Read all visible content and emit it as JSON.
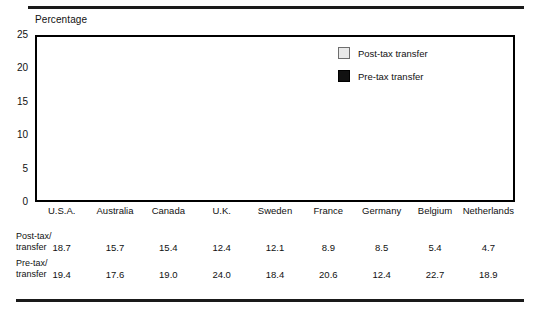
{
  "axis_caption": "Percentage",
  "legend": {
    "items": [
      {
        "label": "Post-tax transfer",
        "key": "post",
        "color": "#e9e9e9"
      },
      {
        "label": "Pre-tax transfer",
        "key": "pre",
        "color": "#111111"
      }
    ]
  },
  "table": {
    "row_labels": [
      "Post-tax/\ntransfer",
      "Pre-tax/\ntransfer"
    ],
    "row_label_post_line1": "Post-tax/",
    "row_label_post_line2": "transfer",
    "row_label_pre_line1": "Pre-tax/",
    "row_label_pre_line2": "transfer"
  },
  "chart_data": {
    "type": "bar",
    "title": "",
    "xlabel": "",
    "ylabel": "Percentage",
    "ylim": [
      0,
      25
    ],
    "yticks": [
      0,
      5,
      10,
      15,
      20,
      25
    ],
    "ytick_labels": [
      "0",
      "5",
      "10",
      "15",
      "20",
      "25"
    ],
    "grid": true,
    "legend_position": "upper-right-inside",
    "categories": [
      "U.S.A.",
      "Australia",
      "Canada",
      "U.K.",
      "Sweden",
      "France",
      "Germany",
      "Belgium",
      "Netherlands"
    ],
    "series": [
      {
        "name": "Post-tax transfer",
        "color": "#e9e9e9",
        "values": [
          18.7,
          15.7,
          15.4,
          12.4,
          12.1,
          8.9,
          8.5,
          5.4,
          4.7
        ],
        "value_labels": [
          "18.7",
          "15.7",
          "15.4",
          "12.4",
          "12.1",
          "8.9",
          "8.5",
          "5.4",
          "4.7"
        ]
      },
      {
        "name": "Pre-tax transfer",
        "color": "#111111",
        "values": [
          19.4,
          17.6,
          19.0,
          24.0,
          18.4,
          20.6,
          12.4,
          22.7,
          18.9
        ],
        "value_labels": [
          "19.4",
          "17.6",
          "19.0",
          "24.0",
          "18.4",
          "20.6",
          "12.4",
          "22.7",
          "18.9"
        ]
      }
    ]
  }
}
